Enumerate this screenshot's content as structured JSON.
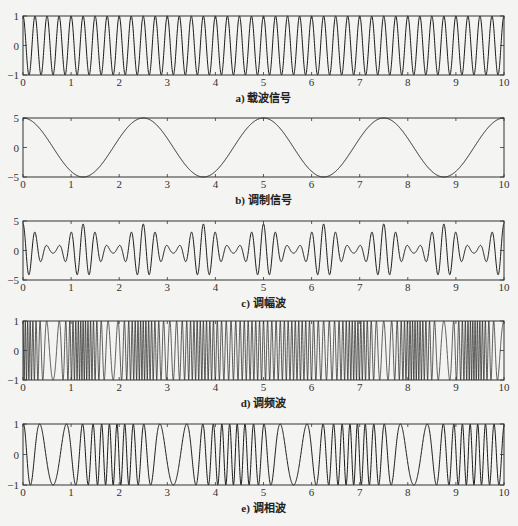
{
  "chart_data": [
    {
      "type": "line",
      "id": "a",
      "caption": "a) 载波信号",
      "title": "",
      "xlabel": "",
      "ylabel": "",
      "xlim": [
        0,
        10
      ],
      "ylim": [
        -1,
        1
      ],
      "xticks": [
        0,
        1,
        2,
        3,
        4,
        5,
        6,
        7,
        8,
        9,
        10
      ],
      "yticks": [
        -1,
        0,
        1
      ],
      "signal": "cos(2*pi*4*t)",
      "series": [
        {
          "name": "carrier",
          "formula": "carrier",
          "amplitude": 1,
          "frequency_hz": 4
        }
      ],
      "grid": false,
      "box": {
        "top": 16,
        "bottom": 75
      }
    },
    {
      "type": "line",
      "id": "b",
      "caption": "b) 调制信号",
      "title": "",
      "xlabel": "",
      "ylabel": "",
      "xlim": [
        0,
        10
      ],
      "ylim": [
        -5,
        5
      ],
      "xticks": [
        0,
        1,
        2,
        3,
        4,
        5,
        6,
        7,
        8,
        9,
        10
      ],
      "yticks": [
        -5,
        0,
        5
      ],
      "signal": "5*cos(2*pi*0.4*t)",
      "series": [
        {
          "name": "modulating",
          "formula": "message",
          "amplitude": 5,
          "frequency_hz": 0.4
        }
      ],
      "grid": false,
      "box": {
        "top": 118,
        "bottom": 177
      }
    },
    {
      "type": "line",
      "id": "c",
      "caption": "c) 调幅波",
      "title": "",
      "xlabel": "",
      "ylabel": "",
      "xlim": [
        0,
        10
      ],
      "ylim": [
        -5,
        5
      ],
      "xticks": [
        0,
        1,
        2,
        3,
        4,
        5,
        6,
        7,
        8,
        9,
        10
      ],
      "yticks": [
        -5,
        0,
        5
      ],
      "signal": "AM wave",
      "series": [
        {
          "name": "am",
          "formula": "am"
        }
      ],
      "grid": false,
      "box": {
        "top": 221,
        "bottom": 280
      }
    },
    {
      "type": "line",
      "id": "d",
      "caption": "d) 调频波",
      "title": "",
      "xlabel": "",
      "ylabel": "",
      "xlim": [
        0,
        10
      ],
      "ylim": [
        -1,
        1
      ],
      "xticks": [
        0,
        1,
        2,
        3,
        4,
        5,
        6,
        7,
        8,
        9,
        10
      ],
      "yticks": [
        -1,
        0,
        1
      ],
      "signal": "FM wave",
      "series": [
        {
          "name": "fm",
          "formula": "fm"
        }
      ],
      "grid": false,
      "box": {
        "top": 321,
        "bottom": 380
      }
    },
    {
      "type": "line",
      "id": "e",
      "caption": "e) 调相波",
      "title": "",
      "xlabel": "",
      "ylabel": "",
      "xlim": [
        0,
        10
      ],
      "ylim": [
        -1,
        1
      ],
      "xticks": [
        0,
        1,
        2,
        3,
        4,
        5,
        6,
        7,
        8,
        9,
        10
      ],
      "yticks": [
        -1,
        0,
        1
      ],
      "signal": "PM wave",
      "series": [
        {
          "name": "pm",
          "formula": "pm"
        }
      ],
      "grid": false,
      "box": {
        "top": 424,
        "bottom": 485
      }
    }
  ],
  "layout": {
    "plot_left": 23,
    "plot_right": 504,
    "line_color": "#1a1a1a",
    "axis_color": "#333333"
  }
}
